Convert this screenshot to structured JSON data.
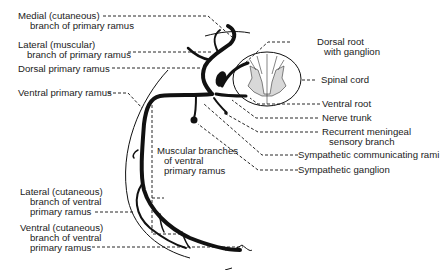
{
  "diagram": {
    "type": "anatomical-illustration",
    "labels_left": {
      "medial_cutaneous": {
        "line1": "Medial (cutaneous)",
        "line2": "branch of primary ramus"
      },
      "lateral_muscular": {
        "line1": "Lateral (muscular)",
        "line2": "branch of primary ramus"
      },
      "dorsal_primary_ramus": {
        "line1": "Dorsal primary ramus"
      },
      "ventral_primary_ramus": {
        "line1": "Ventral primary ramus"
      },
      "lateral_cutaneous_ventral": {
        "line1": "Lateral (cutaneous)",
        "line2": "branch of ventral",
        "line3": "primary ramus"
      },
      "ventral_cutaneous_ventral": {
        "line1": "Ventral (cutaneous)",
        "line2": "branch of ventral",
        "line3": "primary ramus"
      }
    },
    "labels_center": {
      "muscular_branches": {
        "line1": "Muscular branches",
        "line2": "of ventral",
        "line3": "primary ramus"
      }
    },
    "labels_right": {
      "dorsal_root": {
        "line1": "Dorsal root",
        "line2": "with ganglion"
      },
      "spinal_cord": {
        "line1": "Spinal cord"
      },
      "ventral_root": {
        "line1": "Ventral root"
      },
      "nerve_trunk": {
        "line1": "Nerve trunk"
      },
      "recurrent_meningeal": {
        "line1": "Recurrent meningeal",
        "line2": "sensory branch"
      },
      "sympathetic_rami": {
        "line1": "Sympathetic communicating rami"
      },
      "sympathetic_ganglion": {
        "line1": "Sympathetic ganglion"
      }
    },
    "colors": {
      "ink": "#111111",
      "gray_matter": "#d8d8d8",
      "background": "#ffffff"
    }
  }
}
